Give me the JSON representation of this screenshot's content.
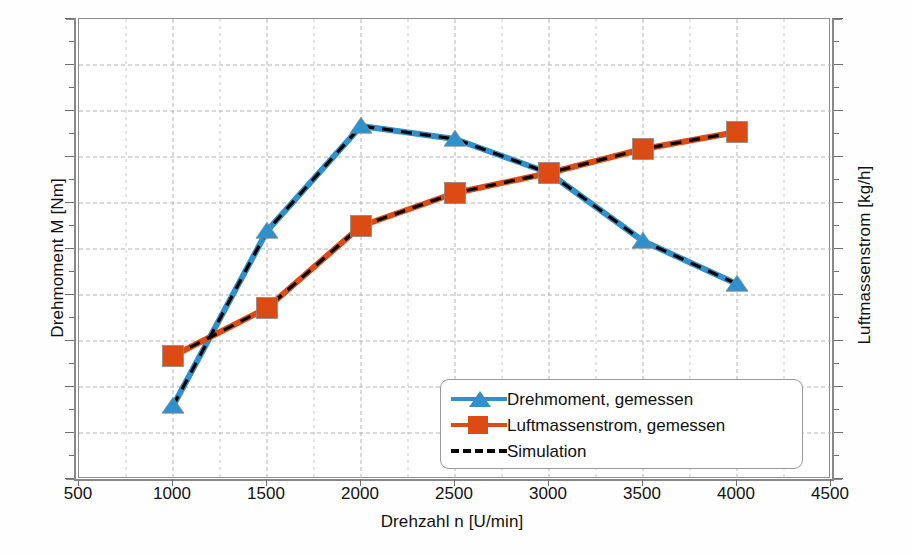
{
  "chart_data": {
    "type": "line",
    "title": "",
    "xlabel": "Drehzahl n [U/min]",
    "ylabel": "Drehmoment M [Nm]",
    "ylabel_right": "Luftmassenstrom [kg/h]",
    "xlim": [
      500,
      4500
    ],
    "xticks": [
      500,
      1000,
      1500,
      2000,
      2500,
      3000,
      3500,
      4000,
      4500
    ],
    "xtick_labels": [
      "500",
      "1000",
      "1500",
      "2000",
      "2500",
      "3000",
      "3500",
      "4000",
      "4500"
    ],
    "ylim_left": [
      0,
      100
    ],
    "ylim_right": [
      0,
      100
    ],
    "yticks_left": [],
    "ytick_labels_left": [],
    "yticks_right": [],
    "ytick_labels_right": [],
    "grid": true,
    "grid_major_color": "#b4b4b4",
    "grid_minor_color": "#c9c9c9",
    "legend_position": "lower right",
    "x": [
      1000,
      1500,
      2000,
      2500,
      3000,
      3500,
      4000
    ],
    "series": [
      {
        "name": "Drehmoment, gemessen",
        "axis": "left",
        "color": "#2e90cc",
        "marker": "triangle",
        "marker_color": "#2e90cc",
        "units": "Nm",
        "values_normalized": [
          16.0,
          54.0,
          76.8,
          74.0,
          66.6,
          51.8,
          42.5
        ],
        "pixel_y": [
          405,
          230,
          125,
          138,
          172,
          240,
          283
        ]
      },
      {
        "name": "Luftmassenstrom, gemessen",
        "axis": "right",
        "color": "#dd4b14",
        "marker": "square",
        "marker_color": "#dd4b14",
        "units": "kg/h",
        "values_normalized": [
          26.7,
          37.2,
          55.0,
          62.2,
          66.6,
          71.8,
          75.4
        ],
        "pixel_y": [
          355,
          307,
          225,
          192,
          172,
          148,
          131
        ]
      },
      {
        "name": "Simulation",
        "axis": "both",
        "color": "#000000",
        "marker": "none",
        "linestyle": "dashed",
        "note": "dashed black overlay tracing both measured curves"
      }
    ]
  },
  "legend": {
    "items": [
      {
        "label": "Drehmoment, gemessen",
        "key": "triangle-line",
        "color": "#2e90cc"
      },
      {
        "label": "Luftmassenstrom, gemessen",
        "key": "square-line",
        "color": "#dd4b14"
      },
      {
        "label": "Simulation",
        "key": "dashed-line",
        "color": "#000000"
      }
    ]
  },
  "colors": {
    "torque_blue": "#2e90cc",
    "airmass_orange": "#dd4b14",
    "simulation_black": "#000000",
    "axis_gray": "#888888",
    "background": "#ffffff"
  }
}
